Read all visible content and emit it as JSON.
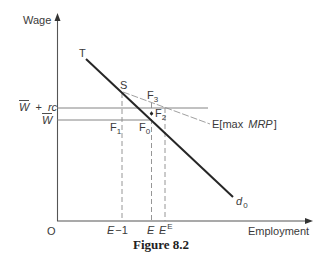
{
  "figure": {
    "caption": "Figure 8.2"
  },
  "axes": {
    "y_label": "Wage",
    "x_label": "Employment",
    "origin": "O"
  },
  "y_levels": {
    "upper": {
      "w": "W",
      "overbar": true,
      "plus": "+",
      "rc": "rc"
    },
    "lower": {
      "w": "W",
      "overbar": true
    }
  },
  "x_ticks": {
    "e_minus_1": {
      "e": "E",
      "rest": "−1"
    },
    "e": {
      "e": "E"
    },
    "e_e": {
      "e": "E",
      "sup": "E"
    }
  },
  "points": {
    "T": "T",
    "S": "S",
    "F0": {
      "f": "F",
      "sub": "0"
    },
    "F1": {
      "f": "F",
      "sub": "1"
    },
    "F2": {
      "f": "F",
      "sub": "2"
    },
    "F3": {
      "f": "F",
      "sub": "3"
    }
  },
  "curves": {
    "demand": {
      "d": "d",
      "sub": "0",
      "style": "solid thick"
    },
    "max_mrp": {
      "open": "E[max ",
      "mrp": "MRP",
      "close": "]",
      "style": "dashed"
    }
  },
  "colors": {
    "main_line": "#262626",
    "guide_lines": "#777777",
    "text": "#3a3a3a",
    "background": "#ffffff"
  }
}
